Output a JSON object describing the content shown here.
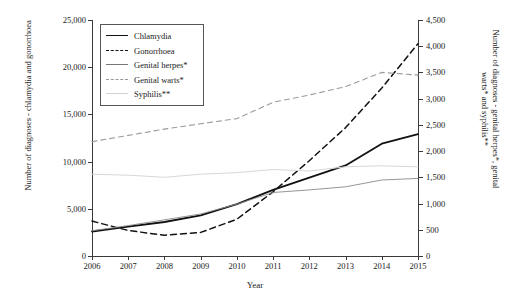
{
  "chart_data": {
    "type": "line",
    "title": "",
    "xlabel": "Year",
    "ylabel": "Number of diagnoses - chlamydia and gonorrhoea",
    "ylabel_right": "Number of diagnoses - genital herpes*, genital warts* and syphilis**",
    "categories": [
      "2006",
      "2007",
      "2008",
      "2009",
      "2010",
      "2011",
      "2012",
      "2013",
      "2014",
      "2015"
    ],
    "ylim": [
      0,
      25000
    ],
    "yticks": [
      "0",
      "5,000",
      "10,000",
      "15,000",
      "20,000",
      "25,000"
    ],
    "ylim_right": [
      0,
      4500
    ],
    "yticks_right": [
      "0",
      "500",
      "1,000",
      "1,500",
      "2,000",
      "2,500",
      "3,000",
      "3,500",
      "4,000",
      "4,500"
    ],
    "grid": false,
    "legend_position": "top-left",
    "series": [
      {
        "name": "Chlamydia",
        "axis": "left",
        "style": "solid",
        "color": "#111111",
        "values": [
          2600,
          3100,
          3600,
          4300,
          5500,
          7000,
          8300,
          9600,
          11900,
          12900
        ]
      },
      {
        "name": "Gonorrhoea",
        "axis": "left",
        "style": "dashed",
        "color": "#111111",
        "values": [
          3700,
          2700,
          2200,
          2500,
          3900,
          6800,
          10100,
          13600,
          17800,
          22500
        ]
      },
      {
        "name": "Genital herpes*",
        "axis": "right",
        "style": "solid",
        "color": "#8a8a8a",
        "values": [
          480,
          580,
          690,
          800,
          990,
          1210,
          1260,
          1320,
          1450,
          1480
        ]
      },
      {
        "name": "Genital warts*",
        "axis": "right",
        "style": "dashed",
        "color": "#9a9a9a",
        "values": [
          2180,
          2300,
          2420,
          2520,
          2620,
          2930,
          3070,
          3230,
          3500,
          3450
        ]
      },
      {
        "name": "Syphilis**",
        "axis": "right",
        "style": "solid",
        "color": "#d8d8d8",
        "values": [
          1560,
          1540,
          1500,
          1560,
          1590,
          1650,
          1620,
          1700,
          1720,
          1700
        ]
      }
    ]
  },
  "legend": {
    "items": [
      {
        "label": "Chlamydia"
      },
      {
        "label": "Gonorrhoea"
      },
      {
        "label": "Genital herpes*"
      },
      {
        "label": "Genital warts*"
      },
      {
        "label": "Syphilis**"
      }
    ]
  }
}
